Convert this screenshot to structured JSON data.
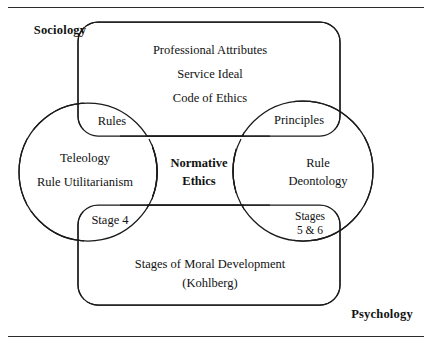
{
  "figure": {
    "title_cropped": "",
    "discipline_labels": {
      "sociology": "Sociology",
      "psychology": "Psychology"
    },
    "top_region": {
      "name": "professional-attributes-region",
      "lines": [
        "Professional Attributes",
        "Service Ideal",
        "Code of Ethics"
      ]
    },
    "left_circle": {
      "name": "teleology-circle",
      "lines": [
        "Teleology",
        "Rule Utilitarianism"
      ]
    },
    "right_circle": {
      "name": "rule-deontology-circle",
      "lines": [
        "Rule",
        "Deontology"
      ]
    },
    "center_band": {
      "name": "normative-ethics-band",
      "lines": [
        "Normative",
        "Ethics"
      ]
    },
    "bottom_region": {
      "name": "moral-development-region",
      "lines": [
        "Stages of Moral Development",
        "(Kohlberg)"
      ]
    },
    "intersections": {
      "top_left": "Rules",
      "top_right": "Principles",
      "bottom_left": "Stage 4",
      "bottom_right_line1": "Stages",
      "bottom_right_line2": "5 & 6"
    },
    "colors": {
      "stroke": "#1a1a1a",
      "background": "#ffffff",
      "text": "#111111",
      "rule": "#2b2b2b"
    }
  }
}
